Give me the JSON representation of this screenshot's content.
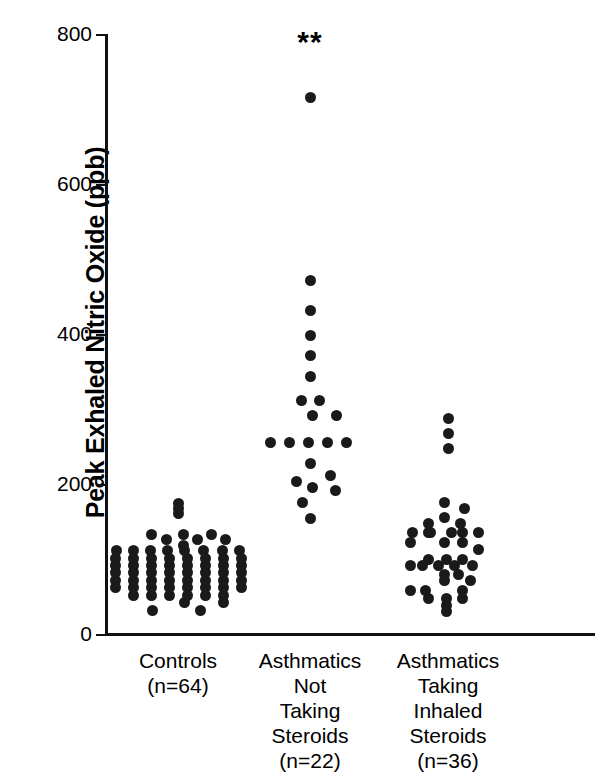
{
  "chart_data": {
    "type": "scatter",
    "plot_style": "dot-plot / strip-plot",
    "title": "",
    "xlabel": "",
    "ylabel": "Peak Exhaled Nitric Oxide (ppb)",
    "ylim": [
      0,
      800
    ],
    "yticks": [
      0,
      200,
      400,
      600,
      800
    ],
    "ytick_labels": [
      "0",
      "200",
      "400",
      "600",
      "800"
    ],
    "grid": false,
    "legend": null,
    "annotations": [
      {
        "text": "**",
        "group": "Asthmatics Not Taking Steroids",
        "value": 790,
        "note": "significance marker above group 2"
      }
    ],
    "categories": [
      "Controls\n(n=64)",
      "Asthmatics\nNot\nTaking\nSteroids\n(n=22)",
      "Asthmatics\nTaking\nInhaled\nSteroids\n(n=36)"
    ],
    "series": [
      {
        "name": "Controls",
        "n": 64,
        "points": [
          {
            "v": 174,
            "o": 0
          },
          {
            "v": 168,
            "o": 0
          },
          {
            "v": 161,
            "o": 0
          },
          {
            "v": 133,
            "o": -27
          },
          {
            "v": 133,
            "o": 5
          },
          {
            "v": 133,
            "o": 33
          },
          {
            "v": 126,
            "o": -12
          },
          {
            "v": 126,
            "o": 19
          },
          {
            "v": 126,
            "o": 47
          },
          {
            "v": 118,
            "o": 5
          },
          {
            "v": 111,
            "o": -62
          },
          {
            "v": 111,
            "o": -45
          },
          {
            "v": 111,
            "o": -28
          },
          {
            "v": 111,
            "o": -11
          },
          {
            "v": 111,
            "o": 6
          },
          {
            "v": 111,
            "o": 25
          },
          {
            "v": 111,
            "o": 44
          },
          {
            "v": 111,
            "o": 61
          },
          {
            "v": 101,
            "o": -63
          },
          {
            "v": 101,
            "o": -45
          },
          {
            "v": 101,
            "o": -27
          },
          {
            "v": 101,
            "o": -9
          },
          {
            "v": 101,
            "o": 9
          },
          {
            "v": 101,
            "o": 27
          },
          {
            "v": 101,
            "o": 45
          },
          {
            "v": 101,
            "o": 63
          },
          {
            "v": 92,
            "o": -63
          },
          {
            "v": 92,
            "o": -45
          },
          {
            "v": 92,
            "o": -27
          },
          {
            "v": 92,
            "o": -9
          },
          {
            "v": 92,
            "o": 9
          },
          {
            "v": 92,
            "o": 27
          },
          {
            "v": 92,
            "o": 45
          },
          {
            "v": 92,
            "o": 63
          },
          {
            "v": 82,
            "o": -63
          },
          {
            "v": 82,
            "o": -45
          },
          {
            "v": 82,
            "o": -27
          },
          {
            "v": 82,
            "o": -9
          },
          {
            "v": 82,
            "o": 9
          },
          {
            "v": 82,
            "o": 27
          },
          {
            "v": 82,
            "o": 45
          },
          {
            "v": 82,
            "o": 63
          },
          {
            "v": 72,
            "o": -63
          },
          {
            "v": 72,
            "o": -45
          },
          {
            "v": 72,
            "o": -27
          },
          {
            "v": 72,
            "o": -9
          },
          {
            "v": 72,
            "o": 9
          },
          {
            "v": 72,
            "o": 27
          },
          {
            "v": 72,
            "o": 45
          },
          {
            "v": 72,
            "o": 63
          },
          {
            "v": 62,
            "o": -63
          },
          {
            "v": 62,
            "o": -45
          },
          {
            "v": 62,
            "o": -27
          },
          {
            "v": 62,
            "o": -9
          },
          {
            "v": 62,
            "o": 9
          },
          {
            "v": 62,
            "o": 27
          },
          {
            "v": 62,
            "o": 45
          },
          {
            "v": 62,
            "o": 63
          },
          {
            "v": 52,
            "o": -45
          },
          {
            "v": 52,
            "o": -27
          },
          {
            "v": 52,
            "o": -9
          },
          {
            "v": 52,
            "o": 9
          },
          {
            "v": 52,
            "o": 27
          },
          {
            "v": 52,
            "o": 45
          },
          {
            "v": 42,
            "o": 6
          },
          {
            "v": 42,
            "o": 45
          },
          {
            "v": 32,
            "o": -26
          },
          {
            "v": 32,
            "o": 22
          }
        ]
      },
      {
        "name": "Asthmatics Not Taking Steroids",
        "n": 22,
        "points": [
          {
            "v": 715,
            "o": 0
          },
          {
            "v": 472,
            "o": 0
          },
          {
            "v": 431,
            "o": 0
          },
          {
            "v": 398,
            "o": 0
          },
          {
            "v": 372,
            "o": 0
          },
          {
            "v": 344,
            "o": 0
          },
          {
            "v": 311,
            "o": -9
          },
          {
            "v": 311,
            "o": 9
          },
          {
            "v": 291,
            "o": 2
          },
          {
            "v": 291,
            "o": 26
          },
          {
            "v": 255,
            "o": -40
          },
          {
            "v": 255,
            "o": -21
          },
          {
            "v": 255,
            "o": -2
          },
          {
            "v": 255,
            "o": 17
          },
          {
            "v": 255,
            "o": 36
          },
          {
            "v": 228,
            "o": 0
          },
          {
            "v": 211,
            "o": 20
          },
          {
            "v": 204,
            "o": -14
          },
          {
            "v": 195,
            "o": 2
          },
          {
            "v": 191,
            "o": 25
          },
          {
            "v": 176,
            "o": -8
          },
          {
            "v": 154,
            "o": 0
          }
        ]
      },
      {
        "name": "Asthmatics Taking Inhaled Steroids",
        "n": 36,
        "points": [
          {
            "v": 287,
            "o": 0
          },
          {
            "v": 267,
            "o": 0
          },
          {
            "v": 247,
            "o": 0
          },
          {
            "v": 175,
            "o": -4
          },
          {
            "v": 167,
            "o": 16
          },
          {
            "v": 155,
            "o": -4
          },
          {
            "v": 148,
            "o": -20
          },
          {
            "v": 148,
            "o": 12
          },
          {
            "v": 136,
            "o": -36
          },
          {
            "v": 136,
            "o": -20
          },
          {
            "v": 136,
            "o": -18
          },
          {
            "v": 136,
            "o": 3
          },
          {
            "v": 136,
            "o": 14
          },
          {
            "v": 136,
            "o": 30
          },
          {
            "v": 122,
            "o": -38
          },
          {
            "v": 122,
            "o": -4
          },
          {
            "v": 122,
            "o": 14
          },
          {
            "v": 113,
            "o": 30
          },
          {
            "v": 100,
            "o": -20
          },
          {
            "v": 100,
            "o": -2
          },
          {
            "v": 100,
            "o": 14
          },
          {
            "v": 92,
            "o": -38
          },
          {
            "v": 92,
            "o": -26
          },
          {
            "v": 92,
            "o": -10
          },
          {
            "v": 92,
            "o": 6
          },
          {
            "v": 92,
            "o": 24
          },
          {
            "v": 80,
            "o": -4
          },
          {
            "v": 80,
            "o": 10
          },
          {
            "v": 72,
            "o": -4
          },
          {
            "v": 72,
            "o": 22
          },
          {
            "v": 58,
            "o": -38
          },
          {
            "v": 58,
            "o": -23
          },
          {
            "v": 58,
            "o": 14
          },
          {
            "v": 48,
            "o": -20
          },
          {
            "v": 48,
            "o": -2
          },
          {
            "v": 48,
            "o": 14
          },
          {
            "v": 38,
            "o": -2
          },
          {
            "v": 30,
            "o": -2
          }
        ]
      }
    ]
  },
  "axis": {
    "ylabel": "Peak Exhaled Nitric Oxide (ppb)",
    "ytick_labels": [
      "800",
      "600",
      "400",
      "200",
      "0"
    ]
  },
  "groups": [
    {
      "label": "Controls\n(n=64)",
      "name": "Controls",
      "n_label": "(n=64)"
    },
    {
      "label": "Asthmatics\nNot\nTaking\nSteroids\n(n=22)",
      "name": "Asthmatics Not Taking Steroids",
      "n_label": "(n=22)"
    },
    {
      "label": "Asthmatics\nTaking\nInhaled\nSteroids\n(n=36)",
      "name": "Asthmatics Taking Inhaled Steroids",
      "n_label": "(n=36)"
    }
  ],
  "markers": {
    "significance": "**"
  },
  "colors": {
    "dot": "#1a1a1a",
    "axis": "#111111",
    "background": "#ffffff"
  }
}
